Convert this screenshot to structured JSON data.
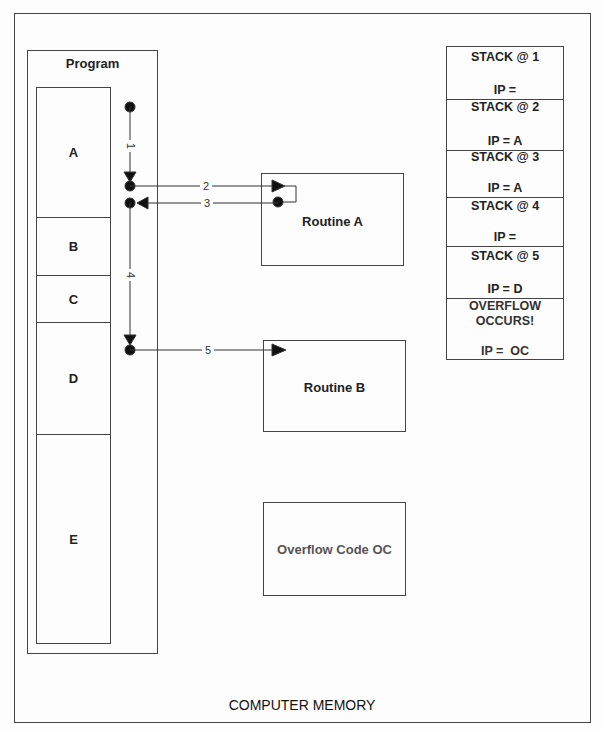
{
  "diagram": {
    "caption": "COMPUTER MEMORY",
    "program": {
      "title": "Program",
      "segments": [
        {
          "label": "A"
        },
        {
          "label": "B"
        },
        {
          "label": "C"
        },
        {
          "label": "D"
        },
        {
          "label": "E"
        }
      ]
    },
    "routines": [
      {
        "label": "Routine A"
      },
      {
        "label": "Routine B"
      },
      {
        "label": "Overflow Code OC"
      }
    ],
    "flow_steps": [
      {
        "label": "1",
        "from": "program-start",
        "to": "call-A"
      },
      {
        "label": "2",
        "from": "call-A",
        "to": "Routine A"
      },
      {
        "label": "3",
        "from": "Routine A",
        "to": "return-A"
      },
      {
        "label": "4",
        "from": "return-A",
        "to": "call-D"
      },
      {
        "label": "5",
        "from": "call-D",
        "to": "Routine B"
      }
    ],
    "stack": [
      {
        "title": "STACK @ 1",
        "ip": "IP ="
      },
      {
        "title": "STACK @ 2",
        "ip": "IP = A"
      },
      {
        "title": "STACK @ 3",
        "ip": "IP = A"
      },
      {
        "title": "STACK @ 4",
        "ip": "IP ="
      },
      {
        "title": "STACK @ 5",
        "ip": "IP = D"
      },
      {
        "title": "OVERFLOW OCCURS!",
        "ip": "IP =  OC"
      }
    ],
    "colors": {
      "line": "#444444",
      "text": "#222222",
      "overflow_text": "#555555",
      "background": "#fdfdfd"
    }
  }
}
